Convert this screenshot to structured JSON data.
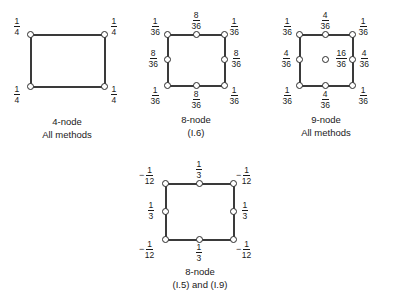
{
  "figures": [
    {
      "id": "four-node",
      "caption_line1": "4-node",
      "caption_line2": "All methods",
      "labels": {
        "top_left": {
          "sign": "",
          "num": "1",
          "den": "4"
        },
        "top_right": {
          "sign": "",
          "num": "1",
          "den": "4"
        },
        "bottom_left": {
          "sign": "",
          "num": "1",
          "den": "4"
        },
        "bottom_right": {
          "sign": "",
          "num": "1",
          "den": "4"
        }
      }
    },
    {
      "id": "eight-node-i6",
      "caption_line1": "8-node",
      "caption_line2": "(I.6)",
      "labels": {
        "top_left": {
          "sign": "",
          "num": "1",
          "den": "36"
        },
        "top_mid": {
          "sign": "",
          "num": "8",
          "den": "36"
        },
        "top_right": {
          "sign": "",
          "num": "1",
          "den": "36"
        },
        "mid_left": {
          "sign": "",
          "num": "8",
          "den": "36"
        },
        "mid_right": {
          "sign": "",
          "num": "8",
          "den": "36"
        },
        "bottom_left": {
          "sign": "",
          "num": "1",
          "den": "36"
        },
        "bottom_mid": {
          "sign": "",
          "num": "8",
          "den": "36"
        },
        "bottom_right": {
          "sign": "",
          "num": "1",
          "den": "36"
        }
      }
    },
    {
      "id": "nine-node",
      "caption_line1": "9-node",
      "caption_line2": "All methods",
      "labels": {
        "top_left": {
          "sign": "",
          "num": "1",
          "den": "36"
        },
        "top_mid": {
          "sign": "",
          "num": "4",
          "den": "36"
        },
        "top_right": {
          "sign": "",
          "num": "1",
          "den": "36"
        },
        "mid_left": {
          "sign": "",
          "num": "4",
          "den": "36"
        },
        "center": {
          "sign": "",
          "num": "16",
          "den": "36"
        },
        "mid_right": {
          "sign": "",
          "num": "4",
          "den": "36"
        },
        "bottom_left": {
          "sign": "",
          "num": "1",
          "den": "36"
        },
        "bottom_mid": {
          "sign": "",
          "num": "4",
          "den": "36"
        },
        "bottom_right": {
          "sign": "",
          "num": "1",
          "den": "36"
        }
      }
    },
    {
      "id": "eight-node-i5-i9",
      "caption_line1": "8-node",
      "caption_line2": "(I.5) and (I.9)",
      "labels": {
        "top_left": {
          "sign": "−",
          "num": "1",
          "den": "12"
        },
        "top_mid": {
          "sign": "",
          "num": "1",
          "den": "3"
        },
        "top_right": {
          "sign": "−",
          "num": "1",
          "den": "12"
        },
        "mid_left": {
          "sign": "",
          "num": "1",
          "den": "3"
        },
        "mid_right": {
          "sign": "",
          "num": "1",
          "den": "3"
        },
        "bottom_left": {
          "sign": "−",
          "num": "1",
          "den": "12"
        },
        "bottom_mid": {
          "sign": "",
          "num": "1",
          "den": "3"
        },
        "bottom_right": {
          "sign": "−",
          "num": "1",
          "den": "12"
        }
      }
    }
  ]
}
